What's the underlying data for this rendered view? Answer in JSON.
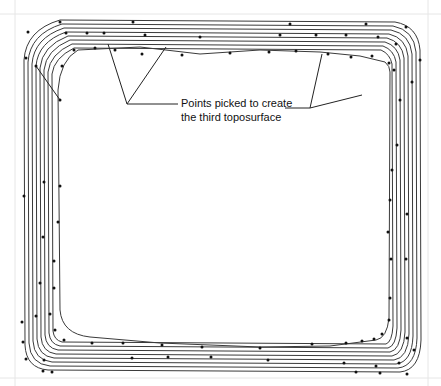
{
  "diagram": {
    "type": "contour-plan",
    "annotation": {
      "line1": "Points picked to create",
      "line2": "the third toposurface"
    },
    "contour_count": 9,
    "line_color": "#3a3a3a",
    "point_color": "#111111",
    "background": "#ffffff"
  },
  "background_bleed": {
    "line1": "...of the toposurface, select the Points command and pick the points you need...",
    "line2": "...to create the third toposurface..."
  }
}
